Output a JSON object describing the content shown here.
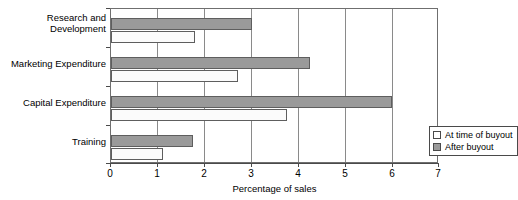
{
  "chart_data": {
    "type": "bar",
    "orientation": "horizontal",
    "title": "",
    "xlabel": "Percentage of sales",
    "ylabel": "",
    "xlim": [
      0,
      7
    ],
    "xticks": [
      "0",
      "1",
      "2",
      "3",
      "4",
      "5",
      "6",
      "7"
    ],
    "grid": true,
    "grid_axis": "x",
    "legend_position": "inside-right",
    "categories": [
      "Research and Development",
      "Marketing Expenditure",
      "Capital Expenditure",
      "Training"
    ],
    "category_lines": [
      [
        "Research and",
        "Development"
      ],
      [
        "Marketing Expenditure"
      ],
      [
        "Capital Expenditure"
      ],
      [
        "Training"
      ]
    ],
    "series": [
      {
        "name": "At time of buyout",
        "color": "#ffffff",
        "values": [
          1.8,
          2.7,
          3.75,
          1.1
        ]
      },
      {
        "name": "After buyout",
        "color": "#9a9a9a",
        "values": [
          3.0,
          4.25,
          6.0,
          1.75
        ]
      }
    ]
  },
  "legend": {
    "items": [
      {
        "label": "At time of buyout",
        "swatch": "attime"
      },
      {
        "label": "After buyout",
        "swatch": "after"
      }
    ]
  }
}
